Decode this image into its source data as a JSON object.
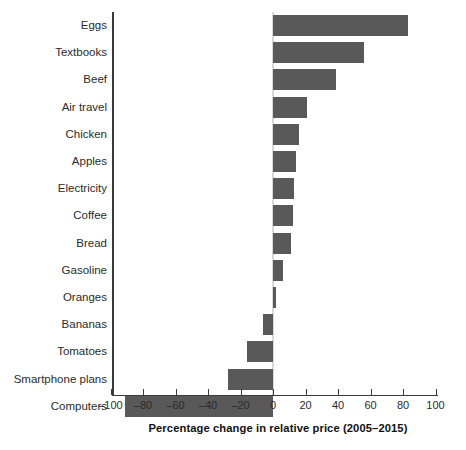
{
  "chart_data": {
    "type": "bar",
    "orientation": "horizontal",
    "title": "",
    "xlabel": "Percentage change in relative price (2005–2015)",
    "ylabel": "",
    "xlim": [
      -100,
      100
    ],
    "xticks": [
      -100,
      -80,
      -60,
      -40,
      -20,
      0,
      20,
      40,
      60,
      80,
      100
    ],
    "xtick_labels": [
      "–100",
      "–80",
      "–60",
      "–40",
      "–20",
      "0",
      "20",
      "40",
      "60",
      "80",
      "100"
    ],
    "grid": false,
    "legend": false,
    "bar_color": "#595959",
    "zero_line_color": "#d8d8d8",
    "axis_color": "#3b3b3b",
    "categories": [
      "Eggs",
      "Textbooks",
      "Beef",
      "Air travel",
      "Chicken",
      "Apples",
      "Electricity",
      "Coffee",
      "Bread",
      "Gasoline",
      "Oranges",
      "Bananas",
      "Tomatoes",
      "Smartphone plans",
      "Computers"
    ],
    "values": [
      83,
      56,
      39,
      21,
      16,
      14,
      13,
      12,
      11,
      6,
      2,
      -6,
      -16,
      -28,
      -91
    ]
  }
}
